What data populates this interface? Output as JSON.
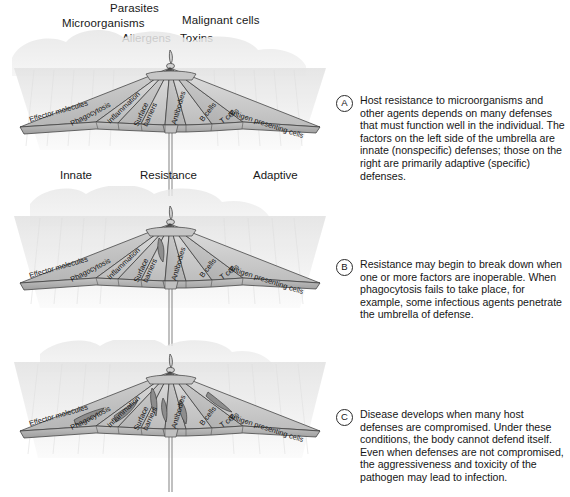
{
  "figure": {
    "threat_labels": [
      "Parasites",
      "Microorganisms",
      "Malignant cells",
      "Allergens",
      "Toxins"
    ],
    "ground_labels": {
      "left": "Innate",
      "center": "Resistance",
      "right": "Adaptive"
    },
    "panel_labels": {
      "left_side_note": "Innate",
      "right_side_note": "Adaptive"
    },
    "umbrella_panel_labels_left": [
      "Effector molecules",
      "Phagocytosis",
      "Inflammation",
      "Surface barriers"
    ],
    "umbrella_panel_labels_right": [
      "Antibodies",
      "B cells",
      "T cells",
      "Antigen presenting cells"
    ],
    "colors": {
      "canopy_light": "#e2e2e2",
      "canopy_mid": "#c9c9c9",
      "canopy_dark": "#a9a9a9",
      "tear_fill": "#8d8d8d",
      "outline": "#3a3a3a",
      "rain": "#ededed",
      "cloud": "#e8e8e8",
      "text": "#161616"
    }
  },
  "panels": [
    {
      "marker": "A",
      "state": "intact",
      "tear_count": 0,
      "text": "Host resistance to microorganisms and other agents depends on many defenses that must function well in the individual. The factors on the left side of the umbrella are innate (nonspecific) defenses; those on the right are primarily adaptive (specific) defenses."
    },
    {
      "marker": "B",
      "state": "partially-damaged",
      "tear_count": 1,
      "text": "Resistance may begin to break down when one or more factors are inoperable. When phagocytosis fails to take place, for example, some infectious agents penetrate the umbrella of defense."
    },
    {
      "marker": "C",
      "state": "heavily-damaged",
      "tear_count": 6,
      "text": "Disease develops when many host defenses are compromised. Under these conditions, the body cannot defend itself. Even when defenses are not compromised, the aggressiveness and toxicity of the pathogen may lead to infection."
    }
  ]
}
